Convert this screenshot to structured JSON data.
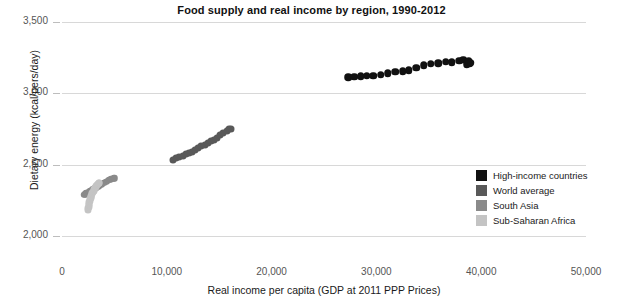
{
  "chart_data": {
    "type": "scatter",
    "title": "Food supply and real income by region, 1990-2012",
    "xlabel": "Real income per capita (GDP at 2011 PPP Prices)",
    "ylabel": "Dietary energy (kcal/pers/day)",
    "xlim": [
      0,
      50000
    ],
    "ylim": [
      2000,
      3500
    ],
    "xticks": [
      "0",
      "10,000",
      "20,000",
      "30,000",
      "40,000",
      "50,000"
    ],
    "xtick_values": [
      0,
      10000,
      20000,
      30000,
      40000,
      50000
    ],
    "yticks": [
      "2,000",
      "2,500",
      "3,000",
      "3,500"
    ],
    "ytick_values": [
      2000,
      2500,
      3000,
      3500
    ],
    "grid": true,
    "legend_position": "bottom-right",
    "series": [
      {
        "name": "High-income countries",
        "color": "#111111",
        "points": [
          [
            27300,
            3112
          ],
          [
            27900,
            3116
          ],
          [
            28500,
            3118
          ],
          [
            29100,
            3122
          ],
          [
            29700,
            3124
          ],
          [
            30400,
            3130
          ],
          [
            31100,
            3142
          ],
          [
            31800,
            3152
          ],
          [
            32500,
            3156
          ],
          [
            33100,
            3162
          ],
          [
            33800,
            3178
          ],
          [
            34500,
            3196
          ],
          [
            35200,
            3206
          ],
          [
            35900,
            3210
          ],
          [
            36600,
            3222
          ],
          [
            37200,
            3218
          ],
          [
            37900,
            3230
          ],
          [
            38300,
            3236
          ],
          [
            38700,
            3222
          ],
          [
            38900,
            3212
          ],
          [
            38600,
            3204
          ],
          [
            38800,
            3228
          ],
          [
            39000,
            3216
          ]
        ]
      },
      {
        "name": "World average",
        "color": "#595959",
        "points": [
          [
            10600,
            2536
          ],
          [
            10900,
            2548
          ],
          [
            11200,
            2552
          ],
          [
            11500,
            2560
          ],
          [
            11800,
            2572
          ],
          [
            12100,
            2582
          ],
          [
            12400,
            2592
          ],
          [
            12700,
            2606
          ],
          [
            13000,
            2616
          ],
          [
            13300,
            2628
          ],
          [
            13600,
            2638
          ],
          [
            13900,
            2650
          ],
          [
            14200,
            2664
          ],
          [
            14500,
            2676
          ],
          [
            14800,
            2690
          ],
          [
            15100,
            2706
          ],
          [
            15400,
            2722
          ],
          [
            15700,
            2736
          ],
          [
            15900,
            2748
          ],
          [
            16100,
            2752
          ]
        ]
      },
      {
        "name": "South Asia",
        "color": "#8a8a8a",
        "points": [
          [
            2100,
            2288
          ],
          [
            2200,
            2294
          ],
          [
            2300,
            2298
          ],
          [
            2400,
            2304
          ],
          [
            2550,
            2310
          ],
          [
            2700,
            2316
          ],
          [
            2850,
            2322
          ],
          [
            3000,
            2330
          ],
          [
            3150,
            2336
          ],
          [
            3300,
            2340
          ],
          [
            3450,
            2346
          ],
          [
            3600,
            2352
          ],
          [
            3750,
            2358
          ],
          [
            3900,
            2366
          ],
          [
            4050,
            2374
          ],
          [
            4200,
            2382
          ],
          [
            4350,
            2388
          ],
          [
            4500,
            2394
          ],
          [
            4650,
            2398
          ],
          [
            4800,
            2402
          ],
          [
            4950,
            2404
          ],
          [
            5050,
            2406
          ]
        ]
      },
      {
        "name": "Sub-Saharan Africa",
        "color": "#c4c4c4",
        "points": [
          [
            2500,
            2182
          ],
          [
            2520,
            2196
          ],
          [
            2540,
            2206
          ],
          [
            2560,
            2216
          ],
          [
            2580,
            2226
          ],
          [
            2600,
            2236
          ],
          [
            2640,
            2246
          ],
          [
            2680,
            2256
          ],
          [
            2720,
            2266
          ],
          [
            2760,
            2274
          ],
          [
            2800,
            2282
          ],
          [
            2850,
            2292
          ],
          [
            2900,
            2300
          ],
          [
            2960,
            2310
          ],
          [
            3020,
            2318
          ],
          [
            3080,
            2326
          ],
          [
            3150,
            2334
          ],
          [
            3220,
            2342
          ],
          [
            3290,
            2350
          ],
          [
            3360,
            2356
          ],
          [
            3430,
            2362
          ],
          [
            3500,
            2368
          ],
          [
            3560,
            2372
          ]
        ]
      }
    ]
  }
}
